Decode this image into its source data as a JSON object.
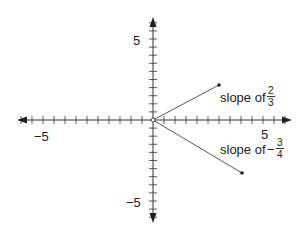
{
  "figure": {
    "x_axis": {
      "min_label": "-5",
      "max_label": "5",
      "neg_label_display": "−5"
    },
    "y_axis": {
      "min_label": "-5",
      "max_label": "5",
      "neg_label_display": "−5"
    },
    "lines": [
      {
        "label_prefix": "slope of",
        "sign": "",
        "numerator": "2",
        "denominator": "3",
        "end": [
          3,
          2
        ]
      },
      {
        "label_prefix": "slope of",
        "sign": "−",
        "numerator": "3",
        "denominator": "4",
        "end": [
          4,
          -3
        ]
      }
    ]
  },
  "chart_data": {
    "type": "line",
    "title": "",
    "xlabel": "",
    "ylabel": "",
    "xlim": [
      -6.5,
      6.5
    ],
    "ylim": [
      -6.5,
      6.5
    ],
    "grid": false,
    "tick_labels": {
      "x": [
        "-5",
        "5"
      ],
      "y": [
        "-5",
        "5"
      ]
    },
    "series": [
      {
        "name": "slope of 2/3",
        "x": [
          0,
          3
        ],
        "y": [
          0,
          2
        ]
      },
      {
        "name": "slope of -3/4",
        "x": [
          0,
          4
        ],
        "y": [
          0,
          -3
        ]
      }
    ]
  }
}
